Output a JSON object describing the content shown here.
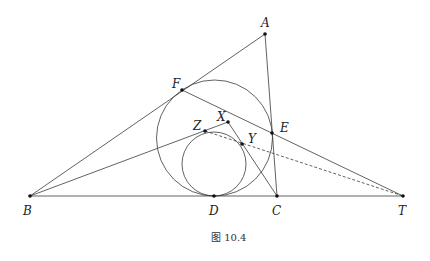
{
  "figure": {
    "caption": "图 10.4",
    "points": {
      "A": "A",
      "B": "B",
      "C": "C",
      "D": "D",
      "E": "E",
      "F": "F",
      "T": "T",
      "X": "X",
      "Y": "Y",
      "Z": "Z"
    },
    "segments": [
      "AB",
      "AC",
      "BT",
      "FT",
      "BZ",
      "XZ",
      "XC",
      "ZT (dashed)"
    ],
    "circles": [
      "incircle of ABC tangent at D, E, F",
      "circle through Z, Y tangent at D"
    ]
  }
}
